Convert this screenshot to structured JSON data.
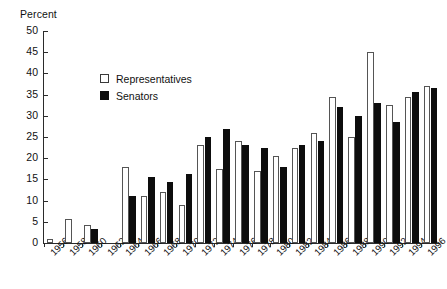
{
  "chart_data": {
    "type": "bar",
    "title": "",
    "subtitle": "",
    "xlabel": "",
    "ylabel": "Percent",
    "ylim": [
      0,
      50
    ],
    "ytick_step": 5,
    "yticks": [
      50,
      45,
      40,
      35,
      30,
      25,
      20,
      15,
      10,
      5,
      0
    ],
    "grid": false,
    "legend_position": "upper-left-inside",
    "categories": [
      "1956",
      "1958",
      "1960",
      "1962",
      "1964",
      "1966",
      "1968",
      "1970",
      "1972",
      "1974",
      "1976",
      "1978",
      "1980",
      "1982",
      "1984",
      "1986",
      "1988",
      "1990",
      "1992",
      "1994",
      "1996"
    ],
    "series": [
      {
        "name": "Representatives",
        "color": "#ffffff",
        "edge_color": "#555555",
        "values": [
          1,
          5.7,
          4.3,
          0,
          18,
          11,
          12,
          9,
          23,
          17.5,
          24,
          17,
          20.5,
          22.5,
          26,
          34.5,
          25,
          45,
          32.5,
          34.5,
          37
        ]
      },
      {
        "name": "Senators",
        "color": "#0d0d0d",
        "edge_color": "#0d0d0d",
        "values": [
          0,
          0,
          3.3,
          0,
          11,
          15.5,
          14.5,
          16.3,
          25,
          27,
          23,
          22.5,
          18,
          23,
          24,
          32,
          30,
          33,
          28.5,
          35.5,
          36.5
        ]
      }
    ]
  },
  "legend": {
    "items": [
      {
        "label": "Representatives",
        "swatch": "open-square"
      },
      {
        "label": "Senators",
        "swatch": "filled-square"
      }
    ]
  },
  "axes": {
    "y_title": "Percent"
  }
}
